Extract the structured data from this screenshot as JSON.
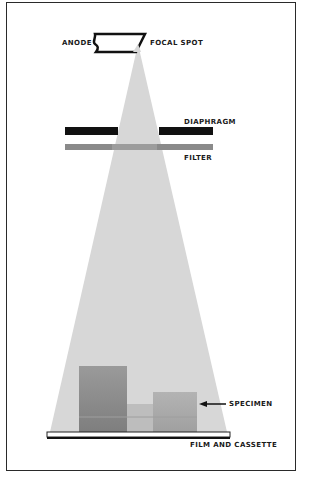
{
  "diagram": {
    "labels": {
      "anode": "ANODE",
      "focal_spot": "FOCAL SPOT",
      "diaphragm": "DIAPHRAGM",
      "filter": "FILTER",
      "specimen": "SPECIMEN",
      "film": "FILM AND CASSETTE"
    },
    "colors": {
      "beam": "#d7d7d7",
      "diaphragm": "#111111",
      "filter": "#8a8a8a",
      "specimen_dark": "#8f8f8f",
      "specimen_light": "#b5b5b5",
      "outline": "#1a1a1a"
    },
    "components": [
      {
        "id": "anode",
        "label_key": "anode"
      },
      {
        "id": "focal-spot",
        "label_key": "focal_spot"
      },
      {
        "id": "diaphragm",
        "label_key": "diaphragm"
      },
      {
        "id": "filter",
        "label_key": "filter"
      },
      {
        "id": "specimen",
        "label_key": "specimen"
      },
      {
        "id": "film-and-cassette",
        "label_key": "film"
      }
    ]
  }
}
